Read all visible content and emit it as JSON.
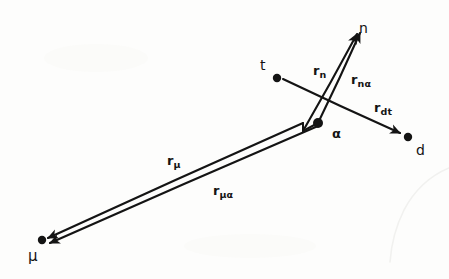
{
  "figure": {
    "kind": "hand-drawn-vector-diagram",
    "medium": "scanned-paper",
    "background_color": "#fdfdfc",
    "ink_color": "#141414"
  },
  "points": [
    {
      "id": "n",
      "label": "n",
      "x": 363,
      "y": 23,
      "dot": false,
      "label_dx": -4,
      "label_dy": -2
    },
    {
      "id": "t",
      "label": "t",
      "x": 277,
      "y": 78,
      "dot": true,
      "label_dx": -17,
      "label_dy": -20
    },
    {
      "id": "alpha",
      "label": "α",
      "x": 318,
      "y": 123,
      "dot": true,
      "label_dx": 14,
      "label_dy": 4
    },
    {
      "id": "d",
      "label": "d",
      "x": 408,
      "y": 137,
      "dot": true,
      "label_dx": 8,
      "label_dy": 6
    },
    {
      "id": "mu",
      "label": "μ",
      "x": 42,
      "y": 240,
      "dot": true,
      "label_dx": -14,
      "label_dy": 9
    }
  ],
  "vectors": [
    {
      "id": "r_n",
      "base": "r",
      "subscript": "n",
      "from": {
        "x": 303,
        "y": 131
      },
      "to": {
        "x": 357,
        "y": 34
      },
      "arrow_at": "to",
      "label_x": 313,
      "label_y": 62
    },
    {
      "id": "r_nalpha",
      "base": "r",
      "subscript": "nα",
      "from": {
        "x": 318,
        "y": 123
      },
      "to": {
        "x": 360,
        "y": 33
      },
      "arrow_at": "to",
      "label_x": 351,
      "label_y": 71
    },
    {
      "id": "r_dt",
      "base": "r",
      "subscript": "dt",
      "from": {
        "x": 283,
        "y": 79
      },
      "to": {
        "x": 400,
        "y": 133
      },
      "arrow_at": "to",
      "label_x": 374,
      "label_y": 99
    },
    {
      "id": "r_mu",
      "base": "r",
      "subscript": "μ",
      "from": {
        "x": 303,
        "y": 123
      },
      "to": {
        "x": 48,
        "y": 238
      },
      "arrow_at": "to",
      "label_x": 167,
      "label_y": 152
    },
    {
      "id": "r_mualpha",
      "base": "r",
      "subscript": "μα",
      "from": {
        "x": 318,
        "y": 126
      },
      "to": {
        "x": 50,
        "y": 243
      },
      "arrow_at": "to",
      "label_x": 213,
      "label_y": 182
    }
  ],
  "connectors": [
    {
      "id": "alpha-to-rn-origin",
      "from": {
        "x": 318,
        "y": 123
      },
      "to": {
        "x": 303,
        "y": 131
      }
    },
    {
      "id": "rn-origin-to-rmu-origin",
      "from": {
        "x": 303,
        "y": 131
      },
      "to": {
        "x": 303,
        "y": 123
      }
    }
  ]
}
